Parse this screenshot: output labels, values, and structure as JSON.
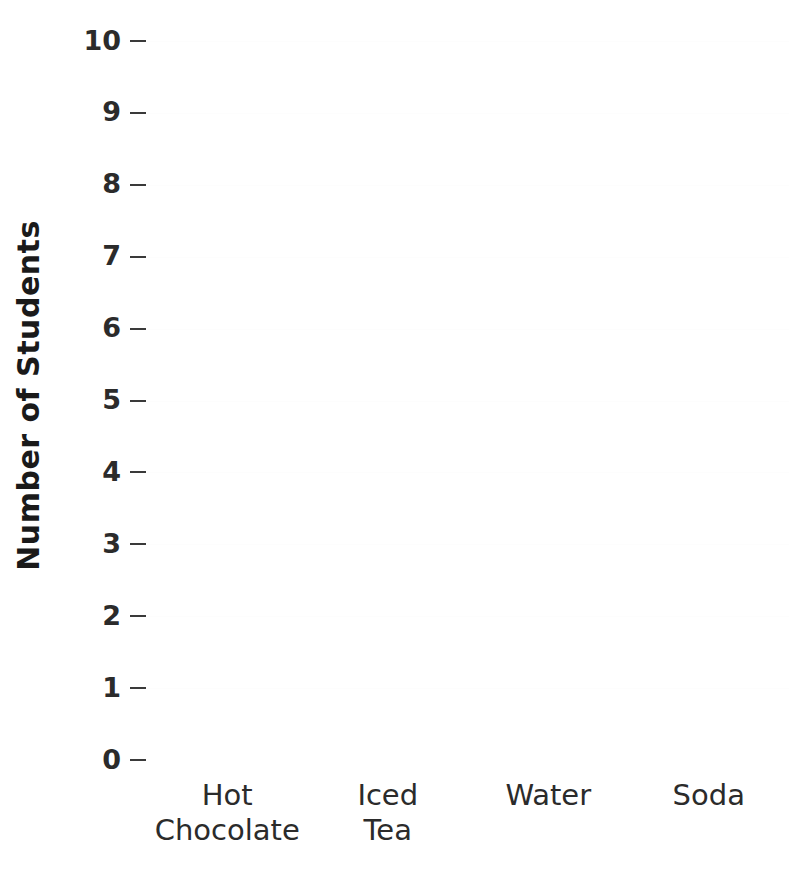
{
  "chart_data": {
    "type": "bar",
    "title": "",
    "xlabel": "",
    "ylabel": "Number of Students",
    "categories": [
      "Hot Chocolate",
      "Iced Tea",
      "Water",
      "Soda"
    ],
    "values": [
      0,
      0,
      0,
      0
    ],
    "ylim": [
      0,
      10
    ],
    "yticks": [
      "0",
      "1",
      "2",
      "3",
      "4",
      "5",
      "6",
      "7",
      "8",
      "9",
      "10"
    ],
    "grid": false,
    "legend": "none",
    "note": "Empty plot area: no bars are drawn for any category."
  },
  "axes": {
    "y_title": "Number of Students",
    "y_tick_labels": [
      "10",
      "9",
      "8",
      "7",
      "6",
      "5",
      "4",
      "3",
      "2",
      "1",
      "0"
    ],
    "x_tick_labels": [
      "Hot\nChocolate",
      "Iced\nTea",
      "Water",
      "Soda"
    ]
  },
  "colors": {
    "background": "#ffffff",
    "tick_label": "#2b2b2b",
    "axis_title": "#1a1a1a",
    "tick_mark": "#3a3a3a"
  }
}
